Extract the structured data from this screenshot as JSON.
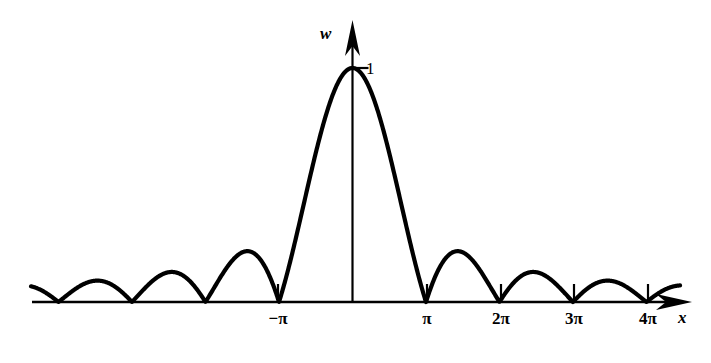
{
  "figure": {
    "background_color": "#ffffff",
    "ink_color": "#000000",
    "width": 711,
    "height": 363
  },
  "axes": {
    "x_axis": {
      "name": "x",
      "label": "x",
      "label_style": "italic",
      "arrow": "right",
      "origin_px": 352.5,
      "unit_px_per_pi": 73.5,
      "baseline_y_px": 302,
      "start_x_px": 32,
      "end_x_px": 692
    },
    "y_axis": {
      "name": "w",
      "label": "w",
      "label_style": "italic",
      "arrow": "up",
      "x_px": 352.5,
      "top_y_px": 20,
      "peak_y_px": 68
    }
  },
  "ticks": {
    "x": [
      {
        "label": "−π",
        "value": -3.14159,
        "x_px": 278
      },
      {
        "label": "π",
        "value": 3.14159,
        "x_px": 427
      },
      {
        "label": "2π",
        "value": 6.28319,
        "x_px": 501
      },
      {
        "label": "3π",
        "value": 9.42478,
        "x_px": 574
      },
      {
        "label": "4π",
        "value": 12.56637,
        "x_px": 648
      }
    ],
    "y": [
      {
        "label": "1",
        "value": 1,
        "y_px": 68
      }
    ]
  },
  "chart_data": {
    "type": "line",
    "title": "",
    "subtitle": "",
    "xlabel": "x",
    "ylabel": "w",
    "grid": false,
    "legend": null,
    "function": "w = |sin(x)/x|",
    "xlim": [
      -13.7,
      14.4
    ],
    "ylim": [
      0,
      1.12
    ],
    "x_tick_labels": [
      "−π",
      "π",
      "2π",
      "3π",
      "4π"
    ],
    "x_tick_values": [
      -3.14159,
      3.14159,
      6.28319,
      9.42478,
      12.56637
    ],
    "y_tick_labels": [
      "1"
    ],
    "y_tick_values": [
      1
    ],
    "annotations": [
      {
        "text": "1",
        "x": 0,
        "y": 1,
        "note": "peak value of main lobe"
      },
      {
        "text": "w",
        "note": "vertical axis name"
      },
      {
        "text": "x",
        "note": "horizontal axis name"
      }
    ],
    "series": [
      {
        "name": "|sin(x)/x|",
        "x": [
          -13.74,
          -13.5,
          -13.0,
          -12.566,
          -12.0,
          -11.5,
          -11.0,
          -10.5,
          -10.0,
          -9.425,
          -9.0,
          -8.5,
          -8.0,
          -7.5,
          -7.0,
          -6.283,
          -6.0,
          -5.5,
          -5.0,
          -4.5,
          -4.0,
          -3.5,
          -3.1416,
          -3.0,
          -2.75,
          -2.5,
          -2.25,
          -2.0,
          -1.75,
          -1.5,
          -1.25,
          -1.0,
          -0.75,
          -0.5,
          -0.25,
          0.0,
          0.25,
          0.5,
          0.75,
          1.0,
          1.25,
          1.5,
          1.75,
          2.0,
          2.25,
          2.5,
          2.75,
          3.0,
          3.1416,
          3.5,
          4.0,
          4.5,
          5.0,
          5.5,
          6.0,
          6.283,
          7.0,
          7.5,
          8.0,
          8.5,
          9.0,
          9.425,
          10.0,
          10.5,
          11.0,
          11.5,
          12.0,
          12.566,
          13.0,
          13.5,
          14.0
        ],
        "y": [
          0.0435,
          0.0596,
          0.0323,
          0.0,
          0.0447,
          0.0827,
          0.0909,
          0.0838,
          0.0544,
          0.0,
          0.0458,
          0.0945,
          0.1237,
          0.1252,
          0.0939,
          0.0,
          0.0466,
          0.1281,
          0.1918,
          0.2174,
          0.1892,
          0.1002,
          0.0,
          0.047,
          0.14,
          0.2394,
          0.3457,
          0.4546,
          0.5617,
          0.665,
          0.7592,
          0.8415,
          0.9089,
          0.9589,
          0.9896,
          1.0,
          0.9896,
          0.9589,
          0.9089,
          0.8415,
          0.7592,
          0.665,
          0.5617,
          0.4546,
          0.3457,
          0.2394,
          0.14,
          0.047,
          0.0,
          0.1002,
          0.1892,
          0.2174,
          0.1918,
          0.1281,
          0.0466,
          0.0,
          0.0939,
          0.1252,
          0.1237,
          0.0945,
          0.0458,
          0.0,
          0.0544,
          0.0838,
          0.0909,
          0.0827,
          0.0447,
          0.0,
          0.0323,
          0.0596,
          0.0707
        ]
      }
    ]
  }
}
